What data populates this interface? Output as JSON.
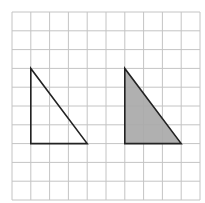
{
  "figure": {
    "label": ")",
    "grid": {
      "origin_x": 12,
      "origin_y": 12,
      "cell_size": 18.8,
      "columns": 10,
      "rows": 10,
      "line_color": "#c4c4c4"
    },
    "shapes": [
      {
        "name": "left-triangle",
        "type": "right-triangle",
        "vertices_grid": [
          [
            1,
            3
          ],
          [
            1,
            7
          ],
          [
            4,
            7
          ]
        ],
        "fill": "none",
        "stroke": "#222222"
      },
      {
        "name": "right-triangle",
        "type": "right-triangle",
        "vertices_grid": [
          [
            6,
            3
          ],
          [
            6,
            7
          ],
          [
            9,
            7
          ]
        ],
        "fill": "#a9a9a9",
        "stroke": "#222222"
      }
    ]
  }
}
